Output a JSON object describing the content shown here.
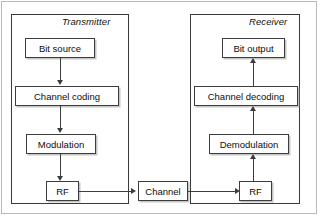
{
  "diagram": {
    "title_groups": [
      {
        "id": "transmitter",
        "label": "Transmitter"
      },
      {
        "id": "receiver",
        "label": "Receiver"
      }
    ],
    "transmitter": {
      "label": "Transmitter",
      "blocks": [
        {
          "id": "bit-source",
          "label": "Bit source"
        },
        {
          "id": "channel-coding",
          "label": "Channel coding"
        },
        {
          "id": "modulation",
          "label": "Modulation"
        },
        {
          "id": "rf",
          "label": "RF"
        }
      ]
    },
    "receiver": {
      "label": "Receiver",
      "blocks": [
        {
          "id": "bit-output",
          "label": "Bit output"
        },
        {
          "id": "channel-decoding",
          "label": "Channel decoding"
        },
        {
          "id": "demodulation",
          "label": "Demodulation"
        },
        {
          "id": "rf",
          "label": "RF"
        }
      ]
    },
    "channel": {
      "id": "channel",
      "label": "Channel"
    },
    "colors": {
      "line": "#3d3d3d",
      "frame": "#3a3a3a",
      "page_border": "#b9b9b9",
      "background": "#ffffff",
      "text": "#0d0d0d"
    }
  }
}
